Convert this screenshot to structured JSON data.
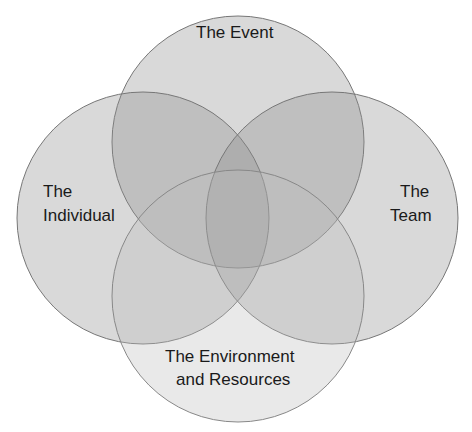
{
  "diagram": {
    "type": "venn",
    "title": "",
    "circles": [
      {
        "id": "event",
        "label": "The Event",
        "cx": 238,
        "cy": 142,
        "r": 126
      },
      {
        "id": "individual",
        "label_lines": [
          "The",
          "Individual"
        ],
        "cx": 143,
        "cy": 218,
        "r": 126
      },
      {
        "id": "team",
        "label_lines": [
          "The",
          "Team"
        ],
        "cx": 332,
        "cy": 218,
        "r": 126
      },
      {
        "id": "environment",
        "label_lines": [
          "The Environment",
          "and Resources"
        ],
        "cx": 238,
        "cy": 296,
        "r": 126
      }
    ],
    "fill_color": "#8c8c8c",
    "fill_opacity": 0.33,
    "stroke_color": "#7a7a7a"
  },
  "labels": {
    "event": "The Event",
    "individual_1": "The",
    "individual_2": "Individual",
    "team_1": "The",
    "team_2": "Team",
    "env_1": "The Environment",
    "env_2": "and Resources"
  }
}
